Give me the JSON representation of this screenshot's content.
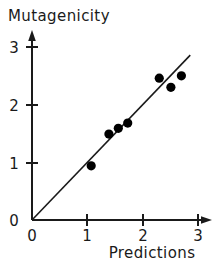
{
  "chart_data": {
    "type": "scatter",
    "title": "",
    "xlabel": "Predictions",
    "ylabel": "Mutagenicity",
    "xlim": [
      0,
      3
    ],
    "ylim": [
      0,
      3
    ],
    "xticks": [
      "0",
      "1",
      "2",
      "3"
    ],
    "yticks": [
      "0",
      "1",
      "2",
      "3"
    ],
    "xtick_values": [
      0,
      1,
      2,
      3
    ],
    "ytick_values": [
      0,
      1,
      2,
      3
    ],
    "grid": false,
    "legend": null,
    "points": [
      {
        "x": 1.07,
        "y": 0.94
      },
      {
        "x": 1.39,
        "y": 1.49
      },
      {
        "x": 1.56,
        "y": 1.59
      },
      {
        "x": 1.73,
        "y": 1.68
      },
      {
        "x": 2.3,
        "y": 2.46
      },
      {
        "x": 2.51,
        "y": 2.3
      },
      {
        "x": 2.7,
        "y": 2.5
      }
    ],
    "reference_line": {
      "name": "identity-line",
      "slope": 1,
      "intercept": 0,
      "x_start": 0,
      "x_end": 2.86
    },
    "marker": {
      "shape": "filled-circle",
      "color": "#000000",
      "radius_px": 4.6
    },
    "axis_style": {
      "color": "#1a1a1a",
      "arrow_tipped": true
    }
  },
  "labels": {
    "y_axis_title": "Mutagenicity",
    "x_axis_title": "Predictions"
  }
}
